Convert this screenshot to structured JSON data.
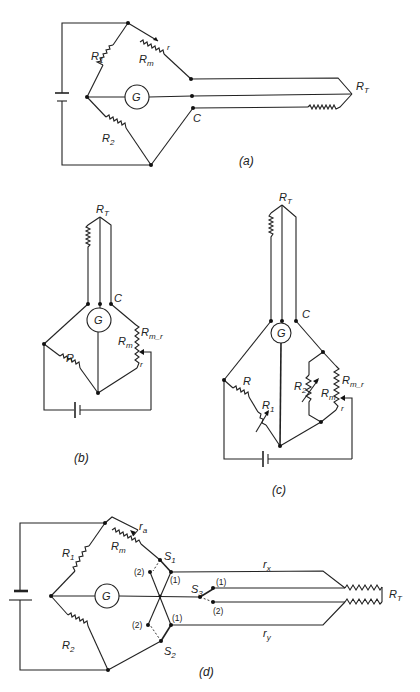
{
  "figure": {
    "panels": [
      {
        "id": "a",
        "caption": "(a)",
        "labels": {
          "R1": "R",
          "R1_sub": "1",
          "R2": "R",
          "R2_sub": "2",
          "Rm": "R",
          "Rm_sub": "m",
          "r": "r",
          "G": "G",
          "C": "C",
          "RT": "R",
          "RT_sub": "T"
        }
      },
      {
        "id": "b",
        "caption": "(b)",
        "labels": {
          "R": "R",
          "G": "G",
          "C": "C",
          "RT": "R",
          "RT_sub": "T",
          "Rm": "R",
          "Rm_sub": "m",
          "Rmr": "R",
          "Rmr_sub": "m_r",
          "r": "r"
        }
      },
      {
        "id": "c",
        "caption": "(c)",
        "labels": {
          "R": "R",
          "R1": "R",
          "R1_sub": "1",
          "R2": "R",
          "R2_sub": "2",
          "G": "G",
          "C": "C",
          "RT": "R",
          "RT_sub": "T",
          "Rm": "R",
          "Rm_sub": "m",
          "Rmr": "R",
          "Rmr_sub": "m_r",
          "r": "r"
        }
      },
      {
        "id": "d",
        "caption": "(d)",
        "labels": {
          "R1": "R",
          "R1_sub": "1",
          "R2": "R",
          "R2_sub": "2",
          "Rm": "R",
          "Rm_sub": "m",
          "ra": "r",
          "ra_sub": "a",
          "G": "G",
          "S1": "S",
          "S1_sub": "1",
          "S2": "S",
          "S2_sub": "2",
          "S3": "S",
          "S3_sub": "3",
          "pos1": "(1)",
          "pos2": "(2)",
          "rx": "r",
          "rx_sub": "x",
          "ry": "r",
          "ry_sub": "y",
          "RT": "R",
          "RT_sub": "T"
        }
      }
    ]
  }
}
